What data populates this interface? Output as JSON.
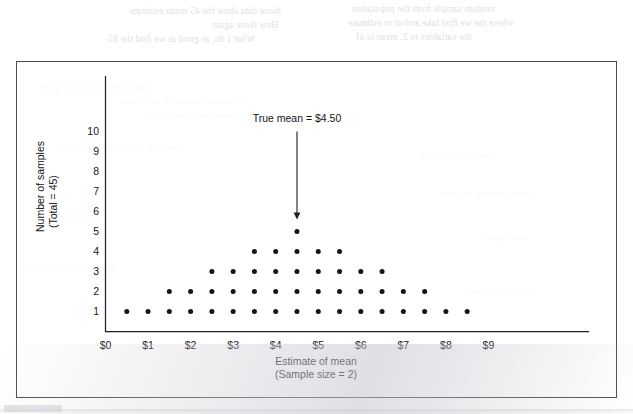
{
  "figure": {
    "background_color": "#ffffff",
    "frame_color": "#4a4a52"
  },
  "chart_data": {
    "type": "scatter",
    "subtype": "dot-plot",
    "title": "",
    "xlabel": "Estimate of mean",
    "xlabel_sub": "(Sample size = 2)",
    "ylabel": "Number of samples",
    "ylabel_sub": "(Total = 45)",
    "xlim": [
      0,
      9.6
    ],
    "ylim": [
      0,
      10.8
    ],
    "grid": false,
    "legend": null,
    "xticks": [
      0,
      1,
      2,
      3,
      4,
      5,
      6,
      7,
      8,
      9
    ],
    "xticklabels": [
      "$0",
      "$1",
      "$2",
      "$3",
      "$4",
      "$5",
      "$6",
      "$7",
      "$8",
      "$9"
    ],
    "yticks": [
      1,
      2,
      3,
      4,
      5,
      6,
      7,
      8,
      9,
      10
    ],
    "yticklabels": [
      "1",
      "2",
      "3",
      "4",
      "5",
      "6",
      "7",
      "8",
      "9",
      "10"
    ],
    "dot_color": "#141418",
    "dot_radius_px": 2.5,
    "bin_width": 0.5,
    "stacks": [
      {
        "x": 0.5,
        "count": 1
      },
      {
        "x": 1.0,
        "count": 1
      },
      {
        "x": 1.5,
        "count": 2
      },
      {
        "x": 2.0,
        "count": 2
      },
      {
        "x": 2.5,
        "count": 3
      },
      {
        "x": 3.0,
        "count": 3
      },
      {
        "x": 3.5,
        "count": 4
      },
      {
        "x": 4.0,
        "count": 4
      },
      {
        "x": 4.5,
        "count": 5
      },
      {
        "x": 5.0,
        "count": 4
      },
      {
        "x": 5.5,
        "count": 4
      },
      {
        "x": 6.0,
        "count": 3
      },
      {
        "x": 6.5,
        "count": 3
      },
      {
        "x": 7.0,
        "count": 2
      },
      {
        "x": 7.5,
        "count": 2
      },
      {
        "x": 8.0,
        "count": 1
      },
      {
        "x": 8.5,
        "count": 1
      }
    ],
    "total_samples": 45,
    "annotations": [
      {
        "text": "True mean = $4.50",
        "x": 4.5,
        "arrow_from_y": 10.0,
        "arrow_to_y": 5.6
      }
    ]
  },
  "ghost_text": {
    "lines": [
      {
        "text": "random sample   from   the population",
        "x": 352,
        "y": 4,
        "size": "small"
      },
      {
        "text": "those data show  the 45 mean estimate",
        "x": 130,
        "y": 6,
        "size": "small"
      },
      {
        "text": "where the  we first  take  and/or to estimate",
        "x": 348,
        "y": 18,
        "size": "small"
      },
      {
        "text": "How  these  again",
        "x": 212,
        "y": 20,
        "size": "small"
      },
      {
        "text": "the  variables  to 2. mean is  of",
        "x": 356,
        "y": 32,
        "size": "small"
      },
      {
        "text": "What  I do,  as  good  as  we  find  the  $5",
        "x": 108,
        "y": 34,
        "size": "small"
      },
      {
        "text": "sample and so in distinct graph",
        "x": 40,
        "y": 82,
        "size": "tiny"
      },
      {
        "text": "of numbers plotted  the  bar  of  each",
        "x": 120,
        "y": 96,
        "size": "tiny"
      },
      {
        "text": "in the estimates  and  it  were  from",
        "x": 150,
        "y": 110,
        "size": "tiny"
      },
      {
        "text": "would  the  of  one  about  how  many",
        "x": 60,
        "y": 142,
        "size": "tiny"
      },
      {
        "text": "samples  of  the  data",
        "x": 420,
        "y": 150,
        "size": "tiny"
      },
      {
        "text": "simple  estimates  the  mean",
        "x": 440,
        "y": 188,
        "size": "tiny"
      },
      {
        "text": "chart  plot  of  their",
        "x": 36,
        "y": 210,
        "size": "tiny"
      },
      {
        "text": "mean  figure",
        "x": 486,
        "y": 232,
        "size": "tiny"
      },
      {
        "text": "the  samples  distribution",
        "x": 30,
        "y": 262,
        "size": "tiny"
      },
      {
        "text": "values  of  a  sample",
        "x": 470,
        "y": 286,
        "size": "tiny"
      }
    ]
  }
}
